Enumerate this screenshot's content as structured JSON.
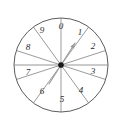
{
  "figure": {
    "name": "spinner-wheel",
    "background_color": "#ffffff"
  },
  "wheel": {
    "center_x": 61,
    "center_y": 65,
    "radius": 47,
    "sector_count": 10,
    "rim_color": "#4a4a4a",
    "spoke_color": "#707070",
    "fill_color": "#ffffff",
    "start_angle_deg": -90,
    "sector_span_deg": 36,
    "direction": "clockwise"
  },
  "sectors": [
    {
      "label": "0",
      "index": 0,
      "center_angle_deg": -72,
      "label_x": 61,
      "label_y": 27
    },
    {
      "label": "1",
      "index": 1,
      "center_angle_deg": -36,
      "label_x": 80,
      "label_y": 33
    },
    {
      "label": "2",
      "index": 2,
      "center_angle_deg": 0,
      "label_x": 93,
      "label_y": 47
    },
    {
      "label": "3",
      "index": 3,
      "center_angle_deg": 36,
      "label_x": 93,
      "label_y": 72
    },
    {
      "label": "4",
      "index": 4,
      "center_angle_deg": 72,
      "label_x": 81,
      "label_y": 91
    },
    {
      "label": "5",
      "index": 5,
      "center_angle_deg": 108,
      "label_x": 62,
      "label_y": 100
    },
    {
      "label": "6",
      "index": 6,
      "center_angle_deg": 144,
      "label_x": 42,
      "label_y": 92
    },
    {
      "label": "7",
      "index": 7,
      "center_angle_deg": 180,
      "label_x": 28,
      "label_y": 73
    },
    {
      "label": "8",
      "index": 8,
      "center_angle_deg": 216,
      "label_x": 28,
      "label_y": 48
    },
    {
      "label": "9",
      "index": 9,
      "center_angle_deg": 252,
      "label_x": 42,
      "label_y": 31
    }
  ],
  "needle": {
    "name": "spinner-needle",
    "pointing_angle_deg": -58,
    "length": 26,
    "color": "#9a9a9a",
    "tip_x": 75,
    "tip_y": 43
  },
  "tail": {
    "name": "spinner-tail",
    "pointing_angle_deg": 122,
    "length": 22,
    "color": "#9a9a9a",
    "tip_x": 49,
    "tip_y": 84
  },
  "pivot": {
    "name": "spinner-pivot",
    "radius": 2.6,
    "color": "#1a1a1a"
  },
  "diameter": {
    "name": "horizontal-diameter",
    "x1": 14,
    "y1": 65,
    "x2": 108,
    "y2": 65,
    "color": "#8a8a8a"
  }
}
